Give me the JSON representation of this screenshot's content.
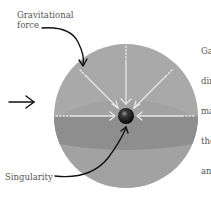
{
  "labels": {
    "gravitational_force": "Gravitational\nforce",
    "singularity": "Singularity",
    "side_text": [
      "Ga",
      "dir",
      "ma",
      "the",
      "an"
    ]
  },
  "colors": {
    "sphere_light": "#a9a9a9",
    "sphere_band": "#8e8e8e",
    "sphere_lower": "#a2a2a2",
    "singularity": "#1a1a1a",
    "force_lines": "#e6e6e6",
    "annotation_arrows": "#111111",
    "text": "#555555"
  },
  "icons": [
    "arrow-right-icon",
    "curved-arrow-icon"
  ]
}
